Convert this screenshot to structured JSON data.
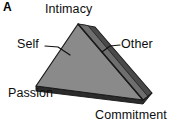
{
  "figure": {
    "panel_letter": "A",
    "labels": {
      "apex": "Intimacy",
      "left_face": "Self",
      "right_face": "Other",
      "bottom_left_vertex": "Passion",
      "bottom_right_vertex": "Commitment"
    },
    "icons": {
      "pyramid": "triangular-pyramid-icon",
      "self_leader": "leader-line-icon",
      "other_leader": "leader-line-icon"
    },
    "colors": {
      "background": "#ffffff",
      "front_left_face": "#8a8a8a",
      "right_face": "#4a4a4a",
      "back_sliver_face": "#6e6e6e",
      "base_edge": "#2b2b2b",
      "outline": "#1a1a1a",
      "text": "#0d0d0d",
      "leader_line": "#111111"
    },
    "geometry": {
      "apex": [
        78,
        24
      ],
      "bottom_left": [
        36,
        86
      ],
      "bottom_right": [
        143,
        100
      ],
      "back_apex": [
        95,
        27
      ],
      "back_right": [
        152,
        93
      ]
    }
  }
}
